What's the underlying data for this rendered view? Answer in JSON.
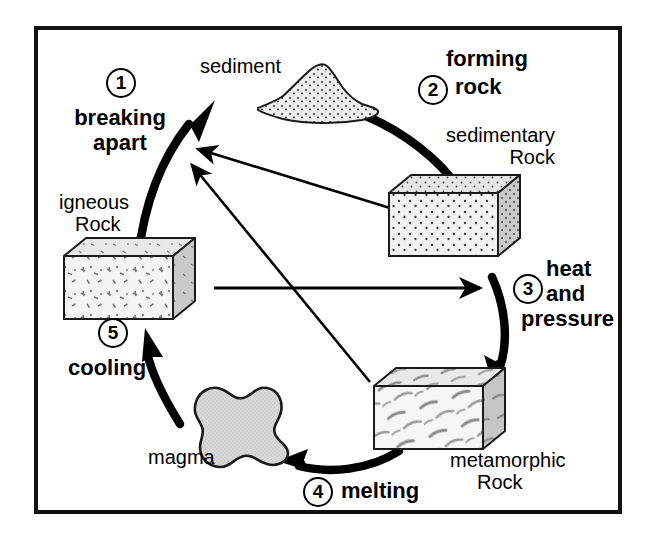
{
  "diagram": {
    "type": "cycle-diagram",
    "border_color": "#111111",
    "background": "#ffffff",
    "steps": [
      {
        "number": "1",
        "label": "breaking\napart",
        "line1": "breaking",
        "line2": "apart"
      },
      {
        "number": "2",
        "label": "forming\nrock",
        "line1": "forming",
        "line2": "rock"
      },
      {
        "number": "3",
        "label": "heat\nand\npressure",
        "line1": "heat",
        "line2": "and",
        "line3": "pressure"
      },
      {
        "number": "4",
        "label": "melting",
        "line1": "melting"
      },
      {
        "number": "5",
        "label": "cooling",
        "line1": "cooling"
      }
    ],
    "materials": [
      {
        "name": "sediment",
        "label": "sediment",
        "shape": "pile"
      },
      {
        "name": "sedimentary-rock",
        "line1": "sedimentary",
        "line2": "Rock",
        "shape": "block"
      },
      {
        "name": "metamorphic-rock",
        "line1": "metamorphic",
        "line2": "Rock",
        "shape": "block"
      },
      {
        "name": "magma",
        "label": "magma",
        "shape": "blob"
      },
      {
        "name": "igneous-rock",
        "line1": "igneous",
        "line2": "Rock",
        "shape": "block"
      }
    ],
    "shortcut_arrows": [
      {
        "from": "sedimentary-rock",
        "to": "breaking-apart"
      },
      {
        "from": "metamorphic-rock",
        "to": "breaking-apart"
      },
      {
        "from": "igneous-rock",
        "to": "heat-and-pressure"
      }
    ]
  }
}
